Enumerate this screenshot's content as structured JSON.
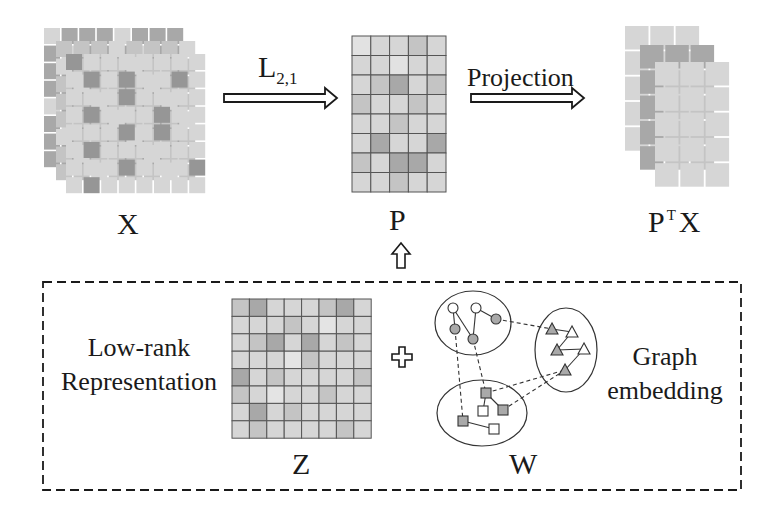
{
  "diagram": {
    "title_hidden": "",
    "colors": {
      "background": "#ffffff",
      "ink": "#1a1a1a",
      "cell_light": "#d6d6d6",
      "cell_mid": "#c4c4c4",
      "cell_dark": "#a8a8a8",
      "cell_darker": "#969696",
      "grid_line": "#555555"
    },
    "labels": {
      "x_matrix": "X",
      "p_matrix": "P",
      "ptx_base": "P",
      "ptx_sup": "T",
      "ptx_tail": "X",
      "z_matrix": "Z",
      "w_graph": "W",
      "l21_base": "L",
      "l21_sub": "2,1",
      "projection": "Projection",
      "low_rank_line1": "Low-rank",
      "low_rank_line2": "Representation",
      "graph_line1": "Graph",
      "graph_line2": "embedding"
    },
    "matrices": {
      "X": {
        "layers": 3,
        "rows": 8,
        "cols": 8,
        "front_dark_cells": [
          [
            0,
            0
          ],
          [
            1,
            1
          ],
          [
            1,
            3
          ],
          [
            1,
            6
          ],
          [
            2,
            3
          ],
          [
            3,
            1
          ],
          [
            3,
            5
          ],
          [
            4,
            3
          ],
          [
            4,
            5
          ],
          [
            5,
            1
          ],
          [
            6,
            3
          ],
          [
            6,
            7
          ],
          [
            7,
            1
          ]
        ]
      },
      "P": {
        "rows": 8,
        "cols": 5,
        "dark_cells": [
          [
            2,
            2
          ],
          [
            5,
            1
          ],
          [
            5,
            4
          ],
          [
            6,
            2
          ],
          [
            6,
            3
          ]
        ],
        "light_cells": [
          [
            0,
            0
          ],
          [
            1,
            2
          ]
        ]
      },
      "PTX": {
        "layers": 3,
        "rows": 5,
        "cols": 3
      },
      "Z": {
        "rows": 8,
        "cols": 8,
        "dark_cells": [
          [
            0,
            1
          ],
          [
            0,
            6
          ],
          [
            4,
            0
          ],
          [
            6,
            1
          ],
          [
            2,
            2
          ],
          [
            2,
            4
          ]
        ],
        "light_cells": [
          [
            1,
            5
          ],
          [
            5,
            2
          ],
          [
            3,
            3
          ]
        ]
      }
    },
    "graph": {
      "clusters": [
        {
          "name": "circles",
          "cx": 473,
          "cy": 323,
          "rx": 38,
          "ry": 32
        },
        {
          "name": "triangles",
          "cx": 566,
          "cy": 350,
          "rx": 31,
          "ry": 42
        },
        {
          "name": "squares",
          "cx": 482,
          "cy": 413,
          "rx": 45,
          "ry": 33
        }
      ],
      "nodes": [
        {
          "id": "c1",
          "shape": "circle",
          "x": 453,
          "y": 308,
          "filled": false
        },
        {
          "id": "c2",
          "shape": "circle",
          "x": 476,
          "y": 308,
          "filled": false
        },
        {
          "id": "c3",
          "shape": "circle",
          "x": 496,
          "y": 319,
          "filled": true
        },
        {
          "id": "c4",
          "shape": "circle",
          "x": 455,
          "y": 329,
          "filled": true
        },
        {
          "id": "c5",
          "shape": "circle",
          "x": 473,
          "y": 339,
          "filled": true
        },
        {
          "id": "t1",
          "shape": "triangle",
          "x": 552,
          "y": 329,
          "filled": true
        },
        {
          "id": "t2",
          "shape": "triangle",
          "x": 572,
          "y": 332,
          "filled": false
        },
        {
          "id": "t3",
          "shape": "triangle",
          "x": 557,
          "y": 350,
          "filled": true
        },
        {
          "id": "t4",
          "shape": "triangle",
          "x": 584,
          "y": 349,
          "filled": false
        },
        {
          "id": "t5",
          "shape": "triangle",
          "x": 565,
          "y": 370,
          "filled": true
        },
        {
          "id": "s1",
          "shape": "square",
          "x": 486,
          "y": 393,
          "filled": true
        },
        {
          "id": "s2",
          "shape": "square",
          "x": 483,
          "y": 411,
          "filled": false
        },
        {
          "id": "s3",
          "shape": "square",
          "x": 503,
          "y": 410,
          "filled": true
        },
        {
          "id": "s4",
          "shape": "square",
          "x": 463,
          "y": 421,
          "filled": true
        },
        {
          "id": "s5",
          "shape": "square",
          "x": 494,
          "y": 429,
          "filled": false
        }
      ],
      "edges": [
        {
          "from": "c1",
          "to": "c5",
          "dashed": false
        },
        {
          "from": "c2",
          "to": "c5",
          "dashed": false
        },
        {
          "from": "c2",
          "to": "c3",
          "dashed": false
        },
        {
          "from": "c1",
          "to": "c4",
          "dashed": false
        },
        {
          "from": "t1",
          "to": "t2",
          "dashed": false
        },
        {
          "from": "t2",
          "to": "t3",
          "dashed": false
        },
        {
          "from": "t3",
          "to": "t4",
          "dashed": false
        },
        {
          "from": "t4",
          "to": "t5",
          "dashed": false
        },
        {
          "from": "s1",
          "to": "s2",
          "dashed": false
        },
        {
          "from": "s1",
          "to": "s3",
          "dashed": false
        },
        {
          "from": "s4",
          "to": "s5",
          "dashed": false
        },
        {
          "from": "c3",
          "to": "t1",
          "dashed": true
        },
        {
          "from": "c4",
          "to": "s4",
          "dashed": true
        },
        {
          "from": "c5",
          "to": "s1",
          "dashed": true
        },
        {
          "from": "s1",
          "to": "t5",
          "dashed": true
        },
        {
          "from": "s3",
          "to": "t5",
          "dashed": true
        }
      ]
    }
  }
}
